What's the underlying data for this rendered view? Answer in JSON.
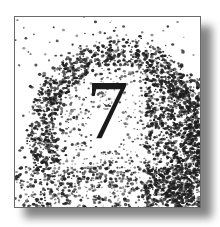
{
  "chapter": {
    "number": "7",
    "digit_color": "#1a1a1a",
    "dot_color": "#1e1e1e",
    "border_color": "#6a6a6a"
  }
}
